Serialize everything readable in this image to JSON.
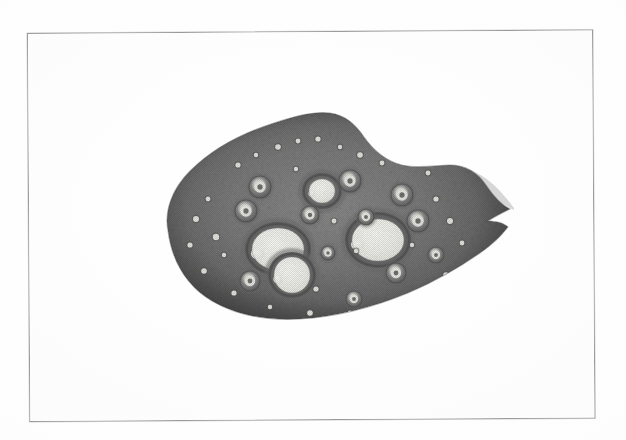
{
  "page": {
    "background_color": "#fefefe",
    "frame_color": "#9a9a9a",
    "frame_fill": "#fdfdfd"
  },
  "figure": {
    "kind": "histological-micrograph",
    "rendering": "grayscale halftone print scan",
    "caption": "",
    "label": "",
    "palette": {
      "stroma_dark": "#5a5a5a",
      "stroma_mid": "#7d7d7d",
      "stroma_light": "#9c9c9c",
      "cortex_edge": "#4e4e4e",
      "lumen_white": "#f4f4f0",
      "lumen_highlight": "#fbfbf7",
      "granulosa_ring": "#6a6a6a",
      "background_white": "#ffffff"
    },
    "specimen_bounds": {
      "x": 150,
      "y": 103,
      "width": 364,
      "height": 228
    },
    "outline_path": "M 18,128 C 14,108 22,86 40,68 C 62,46 92,30 124,20 C 148,12 166,8 180,10 C 196,12 206,22 214,34 C 224,48 236,58 252,62 C 270,66 286,62 300,62 C 316,62 328,70 336,82 C 344,94 352,102 360,106 C 352,110 344,114 338,118 C 346,118 354,120 358,124 C 352,132 342,142 330,150 C 310,164 286,178 258,190 C 224,204 186,214 150,216 C 116,218 86,212 62,198 C 38,184 22,160 18,128 Z",
    "wisp_path": "M 300,62 C 318,64 334,72 346,84 C 356,94 362,102 366,108 C 358,104 348,98 338,92 C 326,84 312,74 300,62 Z",
    "antral_follicles": [
      {
        "id": "follicle-left-large",
        "cx": 128,
        "cy": 146,
        "rx": 33,
        "ry": 27,
        "lumen_rx": 26,
        "lumen_ry": 21,
        "note": "large antral follicle, left-lower"
      },
      {
        "id": "follicle-right-large",
        "cx": 228,
        "cy": 137,
        "rx": 33,
        "ry": 28,
        "lumen_rx": 26,
        "lumen_ry": 21,
        "note": "large antral follicle, right-center"
      },
      {
        "id": "follicle-bottom-mid",
        "cx": 142,
        "cy": 172,
        "rx": 24,
        "ry": 23,
        "lumen_rx": 18,
        "lumen_ry": 18,
        "note": "antral follicle, lower-center"
      },
      {
        "id": "follicle-top-center",
        "cx": 172,
        "cy": 88,
        "rx": 20,
        "ry": 18,
        "lumen_rx": 13,
        "lumen_ry": 12,
        "note": "antral follicle, upper-center"
      }
    ],
    "secondary_follicles": [
      {
        "id": "follicle-sec-1",
        "cx": 110,
        "cy": 84,
        "r": 11
      },
      {
        "id": "follicle-sec-2",
        "cx": 96,
        "cy": 108,
        "r": 11
      },
      {
        "id": "follicle-sec-3",
        "cx": 200,
        "cy": 78,
        "r": 11
      },
      {
        "id": "follicle-sec-4",
        "cx": 252,
        "cy": 92,
        "r": 11
      },
      {
        "id": "follicle-sec-5",
        "cx": 268,
        "cy": 118,
        "r": 11
      },
      {
        "id": "follicle-sec-6",
        "cx": 246,
        "cy": 170,
        "r": 10
      },
      {
        "id": "follicle-sec-7",
        "cx": 100,
        "cy": 178,
        "r": 10
      },
      {
        "id": "follicle-sec-8",
        "cx": 204,
        "cy": 196,
        "r": 8
      },
      {
        "id": "follicle-sec-9",
        "cx": 160,
        "cy": 112,
        "r": 9
      },
      {
        "id": "follicle-sec-10",
        "cx": 216,
        "cy": 114,
        "r": 8
      },
      {
        "id": "follicle-sec-11",
        "cx": 286,
        "cy": 152,
        "r": 8
      },
      {
        "id": "follicle-sec-12",
        "cx": 178,
        "cy": 150,
        "r": 7
      }
    ],
    "primordial_specks": [
      {
        "cx": 46,
        "cy": 116,
        "r": 3.0
      },
      {
        "cx": 58,
        "cy": 96,
        "r": 2.4
      },
      {
        "cx": 40,
        "cy": 142,
        "r": 2.6
      },
      {
        "cx": 66,
        "cy": 134,
        "r": 3.2
      },
      {
        "cx": 74,
        "cy": 152,
        "r": 2.2
      },
      {
        "cx": 54,
        "cy": 168,
        "r": 2.8
      },
      {
        "cx": 88,
        "cy": 62,
        "r": 2.6
      },
      {
        "cx": 106,
        "cy": 52,
        "r": 2.2
      },
      {
        "cx": 128,
        "cy": 44,
        "r": 2.8
      },
      {
        "cx": 148,
        "cy": 38,
        "r": 2.4
      },
      {
        "cx": 168,
        "cy": 36,
        "r": 2.6
      },
      {
        "cx": 190,
        "cy": 44,
        "r": 2.2
      },
      {
        "cx": 210,
        "cy": 52,
        "r": 2.8
      },
      {
        "cx": 232,
        "cy": 60,
        "r": 2.4
      },
      {
        "cx": 286,
        "cy": 96,
        "r": 2.6
      },
      {
        "cx": 300,
        "cy": 118,
        "r": 3.0
      },
      {
        "cx": 312,
        "cy": 140,
        "r": 2.4
      },
      {
        "cx": 296,
        "cy": 172,
        "r": 2.8
      },
      {
        "cx": 272,
        "cy": 190,
        "r": 2.2
      },
      {
        "cx": 240,
        "cy": 200,
        "r": 2.6
      },
      {
        "cx": 200,
        "cy": 210,
        "r": 2.4
      },
      {
        "cx": 160,
        "cy": 210,
        "r": 2.8
      },
      {
        "cx": 120,
        "cy": 204,
        "r": 2.2
      },
      {
        "cx": 84,
        "cy": 190,
        "r": 2.6
      },
      {
        "cx": 146,
        "cy": 66,
        "r": 2.2
      },
      {
        "cx": 184,
        "cy": 118,
        "r": 2.4
      },
      {
        "cx": 206,
        "cy": 148,
        "r": 2.2
      },
      {
        "cx": 166,
        "cy": 186,
        "r": 2.6
      },
      {
        "cx": 262,
        "cy": 142,
        "r": 2.2
      },
      {
        "cx": 278,
        "cy": 70,
        "r": 2.4
      }
    ]
  }
}
